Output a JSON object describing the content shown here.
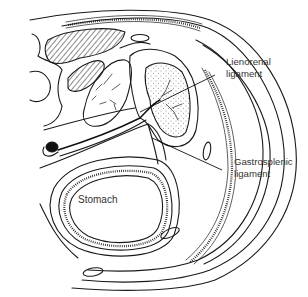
{
  "figure": {
    "type": "anatomical cross-section line drawing",
    "labels": {
      "lienorenal": {
        "line1": "Lienorenal",
        "line2": "ligament"
      },
      "gastrosplenic": {
        "line1": "Gastrosplenic",
        "line2": "ligament"
      },
      "stomach": "Stomach"
    },
    "colors": {
      "ink": "#1a1a1a",
      "label_text": "#333333",
      "background": "#ffffff"
    }
  }
}
